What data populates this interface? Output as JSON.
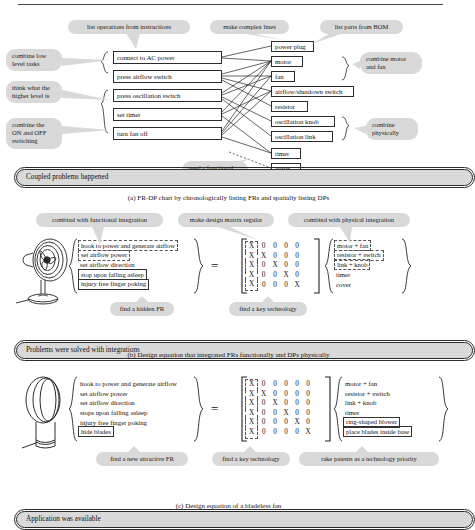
{
  "figure": {
    "panels": [
      {
        "id": "a",
        "caption": "(a) FR-DP chart by chronologically listing FRs and spatially listing DPs",
        "top_callouts": [
          "list operations from instructions",
          "make complex lines",
          "list parts from BOM"
        ],
        "left_callouts": [
          "combine low\nlevel tasks",
          "think what the\nhigher level is",
          "combine the\nON and OFF\nswitching"
        ],
        "right_callouts": [
          "combine motor\nand fan",
          "combine\nphysically"
        ],
        "bottom_callout": "need a functional\nrequirement",
        "fr_boxes": [
          "connect to AC power",
          "press airflow switch",
          "press oscillation switch",
          "set timer",
          "turn fan off"
        ],
        "dp_boxes": [
          "power plug",
          "motor",
          "fan",
          "airflow/shutdown switch",
          "resistor",
          "oscillation knob",
          "oscillation link",
          "timer",
          "cover"
        ],
        "result_capsule": "Coupled problems happened"
      },
      {
        "id": "b",
        "caption": "(b) Design equation that integrated FRs functionally and DPs physically",
        "top_callouts": [
          "combind with functional integration",
          "make design matrix regular",
          "combind with physical integration"
        ],
        "bottom_callouts": [
          "find a hidden FR",
          "find a key technology"
        ],
        "frs": [
          {
            "text": "hook to power and generate airflow",
            "style": "dashed"
          },
          {
            "text": "set airflow power",
            "style": "dashed"
          },
          {
            "text": "set airflow direction",
            "style": "plain"
          },
          {
            "text": "stop upon falling asleep",
            "style": "solid"
          },
          {
            "text": "injury free finger poking",
            "style": "solid"
          }
        ],
        "dps": [
          {
            "text": "motor + fan",
            "style": "dashed"
          },
          {
            "text": "resistor + switch",
            "style": "dashed"
          },
          {
            "text": "link + knob",
            "style": "dashed"
          },
          {
            "text": "timer",
            "style": "plain"
          },
          {
            "text": "cover",
            "style": "plain"
          }
        ],
        "equals": "=",
        "matrix": [
          [
            "X",
            "0",
            "0",
            "0",
            "0"
          ],
          [
            "X",
            "X",
            "0",
            "0",
            "0"
          ],
          [
            "X",
            "0",
            "X",
            "0",
            "0"
          ],
          [
            "X",
            "0",
            "0",
            "X",
            "0"
          ],
          [
            "X",
            "0",
            "0",
            "0",
            "X"
          ]
        ],
        "sketch": "pedestal-fan-drawing",
        "result_capsule": "Problems were solved with integrations"
      },
      {
        "id": "c",
        "caption": "(c) Design equation of a bladeless fan",
        "top_callouts": [],
        "bottom_callouts": [
          "find a new attractive FR",
          "find a key technology",
          "take patents as a technology priority"
        ],
        "frs": [
          {
            "text": "hook to power and generate airflow",
            "style": "plain"
          },
          {
            "text": "set airflow power",
            "style": "plain"
          },
          {
            "text": "set airflow direction",
            "style": "plain"
          },
          {
            "text": "stops upon falling asleep",
            "style": "plain"
          },
          {
            "text": "injury free finger poking",
            "style": "plain"
          },
          {
            "text": "hide blades",
            "style": "solid"
          }
        ],
        "dps": [
          {
            "text": "motor + fan",
            "style": "plain"
          },
          {
            "text": "resistor + switch",
            "style": "plain"
          },
          {
            "text": "link + knob",
            "style": "plain"
          },
          {
            "text": "timer",
            "style": "plain"
          },
          {
            "text": "ring-shaped blower",
            "style": "solid"
          },
          {
            "text": "place blades inside base",
            "style": "solid"
          }
        ],
        "equals": "=",
        "matrix": [
          [
            "X",
            "0",
            "0",
            "0",
            "0",
            "0"
          ],
          [
            "X",
            "X",
            "0",
            "0",
            "0",
            "0"
          ],
          [
            "X",
            "0",
            "X",
            "0",
            "0",
            "0"
          ],
          [
            "X",
            "0",
            "0",
            "X",
            "0",
            "0"
          ],
          [
            "X",
            "0",
            "0",
            "0",
            "X",
            "0"
          ],
          [
            "X",
            "0",
            "0",
            "0",
            "0",
            "X"
          ]
        ],
        "sketch": "bladeless-fan-drawing",
        "result_capsule": "Application was available"
      }
    ]
  },
  "colors": {
    "bubble_fill": "#d9d9d9",
    "line": "#2b2b2b",
    "page": "#ffffff"
  }
}
